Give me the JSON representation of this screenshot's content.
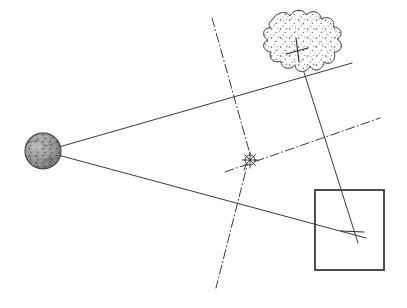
{
  "canvas": {
    "width": 407,
    "height": 308,
    "background": "#ffffff",
    "title": "Optical ray geometry diagram"
  },
  "style": {
    "ink": "#3a3a3a",
    "ink_dark": "#2b2b2b",
    "stipple": "#555555",
    "sphere_fill": "#8d8d8d",
    "sphere_edge": "#3a3a3a",
    "blob_fill": "#fdfdfd",
    "blob_edge": "#4a4a4a",
    "ray_width": 1.0,
    "rect_width": 1.8,
    "dashdot_pattern": "9 3 1 3"
  },
  "objects": {
    "source_sphere": {
      "label": "textured-sphere",
      "cx": 43,
      "cy": 151,
      "r": 18
    },
    "cloud_blob": {
      "label": "stippled-irregular-blob",
      "cx": 300,
      "cy": 45,
      "rx": 38,
      "ry": 32,
      "marker": {
        "x": 297,
        "y": 51,
        "size": 13
      }
    },
    "target_rect": {
      "label": "square-frame",
      "x": 315,
      "y": 190,
      "width": 69,
      "height": 80
    },
    "center_node": {
      "label": "small-compass-rose",
      "cx": 250,
      "cy": 160,
      "r": 5
    },
    "focus_point": {
      "label": "ray-convergence-point",
      "x": 352,
      "y": 233
    }
  },
  "rays": [
    {
      "name": "upper-ray",
      "from": {
        "x": 59,
        "y": 147
      },
      "to": {
        "x": 352,
        "y": 63
      }
    },
    {
      "name": "lower-ray",
      "from": {
        "x": 58,
        "y": 155
      },
      "to": {
        "x": 366,
        "y": 238
      }
    },
    {
      "name": "blob-to-focus-ray",
      "from": {
        "x": 295,
        "y": 44
      },
      "to": {
        "x": 358,
        "y": 243
      }
    }
  ],
  "axes": [
    {
      "name": "vertical-dashdot-axis",
      "from": {
        "x": 212,
        "y": 18
      },
      "to": {
        "x": 216,
        "y": 288
      },
      "bend": {
        "x": 250,
        "y": 160
      }
    },
    {
      "name": "oblique-dashdot-axis",
      "from": {
        "x": 225,
        "y": 172
      },
      "to": {
        "x": 380,
        "y": 118
      }
    }
  ],
  "markers": {
    "blob_tick": {
      "x": 297,
      "y": 51
    },
    "focus_tick": {
      "x": 352,
      "y": 233
    }
  },
  "legend": {
    "solid_line": "light ray",
    "dash_dot_line": "optical axis",
    "sphere": "light source",
    "blob": "diffusing medium",
    "rect": "image plane"
  }
}
